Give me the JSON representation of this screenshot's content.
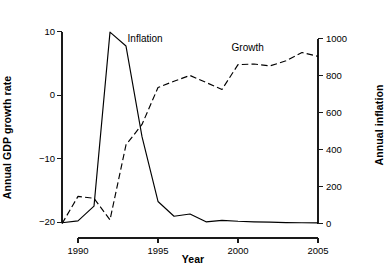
{
  "chart_data": {
    "type": "line",
    "title": "",
    "xlabel": "Year",
    "ylabel": "Annual GDP growth rate",
    "y2label": "Annual inflation",
    "grid": false,
    "legend_position": "inline-annotations",
    "xlim": [
      1989,
      2005
    ],
    "ylim": [
      -21.5,
      11.5
    ],
    "y2lim": [
      -45,
      1090
    ],
    "xticks": [
      "1990",
      "1995",
      "2000",
      "2005"
    ],
    "xtick_values": [
      1990,
      1995,
      2000,
      2005
    ],
    "yticks": [
      "10",
      "0",
      "-10",
      "-20"
    ],
    "ytick_values": [
      10,
      0,
      -10,
      -20
    ],
    "y2ticks": [
      "1000",
      "800",
      "600",
      "400",
      "200",
      "0"
    ],
    "y2tick_values": [
      1000,
      800,
      600,
      400,
      200,
      0
    ],
    "x": [
      1989,
      1990,
      1991,
      1992,
      1993,
      1994,
      1995,
      1996,
      1997,
      1998,
      1999,
      2000,
      2001,
      2002,
      2003,
      2004,
      2005
    ],
    "series": [
      {
        "name": "Inflation",
        "axis": "right",
        "style": "solid",
        "color": "#000000",
        "label_x": 1993.1,
        "label_y": 8.6,
        "values": [
          5,
          15,
          95,
          1035,
          960,
          470,
          120,
          40,
          52,
          10,
          18,
          13,
          10,
          8,
          6,
          5,
          4
        ]
      },
      {
        "name": "Growth",
        "axis": "left",
        "style": "dashed",
        "color": "#000000",
        "label_x": 1999.6,
        "label_y": 7.3,
        "values": [
          -20.2,
          -15.9,
          -16.2,
          -19.6,
          -7.8,
          -4.6,
          1.2,
          2.2,
          3.1,
          2.0,
          0.9,
          4.8,
          4.9,
          4.6,
          5.4,
          6.7,
          6.1
        ]
      }
    ],
    "annotations": [
      {
        "text": "Inflation",
        "x": 1993.1,
        "y": 8.6
      },
      {
        "text": "Growth",
        "x": 1999.6,
        "y": 7.3
      }
    ]
  },
  "axes": {
    "x_title": "Year",
    "y_left_title": "Annual GDP growth rate",
    "y_right_title": "Annual inflation"
  },
  "colors": {
    "ink": "#000000",
    "background": "#ffffff"
  }
}
